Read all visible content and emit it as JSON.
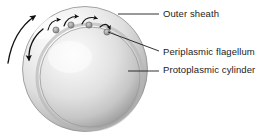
{
  "figure": {
    "background_color": "#ffffff",
    "line_color": "#1b1b1b",
    "structures": {
      "outer_sheath": {
        "name": "outer-sheath",
        "shape": "circle",
        "cx": 85,
        "cy": 69,
        "r": 63,
        "fill_light": "#fdfdfd",
        "fill_mid": "#d8d8d8",
        "fill_dark": "#a8a8a8"
      },
      "protoplasmic_cylinder": {
        "name": "protoplasmic-cylinder",
        "shape": "circle",
        "cx": 90,
        "cy": 77,
        "r": 50,
        "fill_light": "#f4f4f4",
        "fill_mid": "#dcdcdc",
        "fill_dark": "#9a9a9a"
      },
      "periplasmic_flagella": {
        "name": "periplasmic-flagellum",
        "count": 4,
        "dot_radius": 3.1,
        "dot_fill": "#9c9c9c",
        "dot_stroke": "#6b6b6b",
        "positions": [
          {
            "cx": 56,
            "cy": 30
          },
          {
            "cx": 71,
            "cy": 25
          },
          {
            "cx": 89,
            "cy": 25
          },
          {
            "cx": 107,
            "cy": 32
          }
        ]
      }
    },
    "motion_arrows": {
      "name": "rotation-arrows",
      "small_count": 4,
      "large_count": 2,
      "description": "curved arrows indicating flagellar rotation and cell movement"
    }
  },
  "callouts": [
    {
      "id": "outer-sheath",
      "label": "Outer sheath",
      "leader": {
        "type": "straight",
        "x1": 118,
        "y1": 14,
        "x2": 159,
        "y2": 14
      }
    },
    {
      "id": "periplasmic-flagellum",
      "label": "Periplasmic flagellum",
      "leader": {
        "type": "straight",
        "x1": 108,
        "y1": 32,
        "x2": 159,
        "y2": 51
      }
    },
    {
      "id": "protoplasmic-cylinder",
      "label": "Protoplasmic cylinder",
      "leader": {
        "type": "straight",
        "x1": 128,
        "y1": 71,
        "x2": 159,
        "y2": 71
      }
    }
  ]
}
